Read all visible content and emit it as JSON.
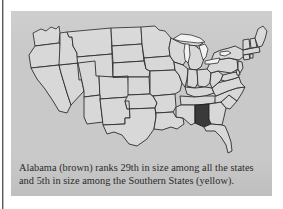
{
  "figure": {
    "panel_bg_color": "#c9c9c9",
    "page_bg_color": "#ffffff",
    "caption": {
      "line1": "Alabama (brown) ranks 29th in size among all the states",
      "line2": "and 5th in size among the Southern States (yellow)."
    }
  },
  "map": {
    "title": "United States map",
    "state_fill_color": "#d8d8d8",
    "state_border_color": "#2d2d2d",
    "highlight_fill_color": "#3a3a3a",
    "lake_fill_color": "#f2f2f2",
    "highlighted_state": "Alabama",
    "highlight_legend_label": "brown",
    "region_legend_label": "yellow",
    "rank_all_states": "29th",
    "rank_southern_states": "5th",
    "states": [
      "Washington",
      "Oregon",
      "California",
      "Nevada",
      "Idaho",
      "Montana",
      "Wyoming",
      "Utah",
      "Arizona",
      "Colorado",
      "New Mexico",
      "North Dakota",
      "South Dakota",
      "Nebraska",
      "Kansas",
      "Oklahoma",
      "Texas",
      "Minnesota",
      "Iowa",
      "Missouri",
      "Arkansas",
      "Louisiana",
      "Wisconsin",
      "Illinois",
      "Michigan",
      "Indiana",
      "Ohio",
      "Kentucky",
      "Tennessee",
      "Mississippi",
      "Alabama",
      "Georgia",
      "Florida",
      "South Carolina",
      "North Carolina",
      "Virginia",
      "West Virginia",
      "Maryland",
      "Delaware",
      "Pennsylvania",
      "New Jersey",
      "New York",
      "Connecticut",
      "Rhode Island",
      "Massachusetts",
      "Vermont",
      "New Hampshire",
      "Maine"
    ],
    "lakes": [
      "Lake Superior",
      "Lake Michigan",
      "Lake Huron",
      "Lake Erie",
      "Lake Ontario"
    ]
  }
}
